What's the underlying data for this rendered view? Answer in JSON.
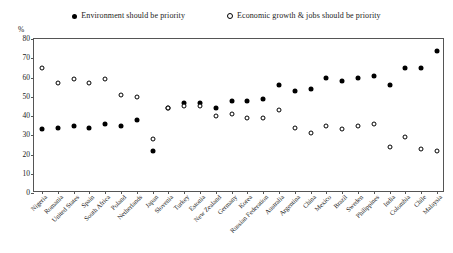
{
  "legend": {
    "entries": [
      {
        "label": "Environment should be priority",
        "marker": "filled-circle-icon"
      },
      {
        "label": "Economic growth & jobs should be priority",
        "marker": "hollow-circle-icon"
      }
    ]
  },
  "axis": {
    "unit_label": "%",
    "y_ticks": [
      "0",
      "10",
      "20",
      "30",
      "40",
      "50",
      "60",
      "70",
      "80"
    ]
  },
  "chart_data": {
    "type": "scatter",
    "title": "",
    "subtitle": "",
    "xlabel": "",
    "ylabel": "%",
    "ylim": [
      0,
      80
    ],
    "ytick_step": 10,
    "grid": false,
    "legend_position": "top-center",
    "categories": [
      "Nigeria",
      "Romania",
      "United States",
      "Spain",
      "South Africa",
      "Poland",
      "Netherlands",
      "Japan",
      "Slovenia",
      "Turkey",
      "Estonia",
      "New Zealand",
      "Germany",
      "Korea",
      "Russian Federation",
      "Australia",
      "Argentina",
      "China",
      "Mexico",
      "Brazil",
      "Sweden",
      "Philippines",
      "India",
      "Colombia",
      "Chile",
      "Malaysia"
    ],
    "series": [
      {
        "name": "Environment should be priority",
        "marker": "filled-circle",
        "color": "#000000",
        "values": [
          33,
          34,
          35,
          34,
          36,
          35,
          38,
          22,
          44,
          47,
          47,
          44,
          48,
          48,
          49,
          56,
          53,
          54,
          60,
          58,
          60,
          61,
          56,
          65,
          65,
          74
        ]
      },
      {
        "name": "Economic growth & jobs should be priority",
        "marker": "hollow-circle",
        "color": "#ffffff",
        "values": [
          65,
          57,
          59,
          57,
          59,
          51,
          50,
          28,
          44,
          45,
          45,
          40,
          41,
          39,
          39,
          43,
          34,
          31,
          35,
          33,
          35,
          36,
          24,
          29,
          23,
          22
        ]
      }
    ]
  }
}
